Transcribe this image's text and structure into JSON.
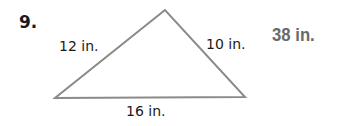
{
  "problem": {
    "number": "9.",
    "answer": "38 in.",
    "answer_color": "#6a6a6a"
  },
  "triangle": {
    "vertices": [
      [
        165,
        10
      ],
      [
        55,
        98
      ],
      [
        245,
        97
      ]
    ],
    "stroke_color": "#8a8a8a",
    "sides": {
      "left": "12 in.",
      "right": "10 in.",
      "bottom": "16 in."
    }
  }
}
